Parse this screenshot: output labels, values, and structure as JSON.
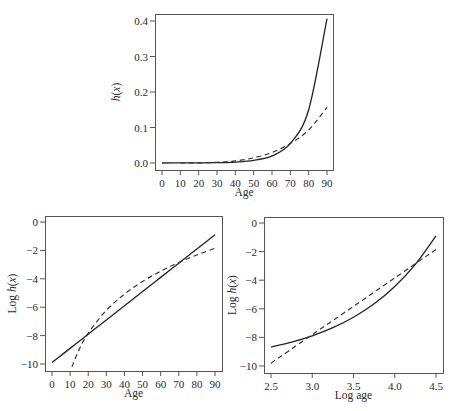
{
  "chart_data": [
    {
      "id": "top",
      "type": "line",
      "title": "",
      "xlabel": "Age",
      "ylabel": "h(x)",
      "xlim": [
        0,
        90
      ],
      "ylim": [
        0.0,
        0.4
      ],
      "xticks": [
        0,
        10,
        20,
        30,
        40,
        50,
        60,
        70,
        80,
        90
      ],
      "xtick_labels": [
        "0",
        "10",
        "20",
        "30",
        "40",
        "50",
        "60",
        "70",
        "80",
        "90"
      ],
      "yticks": [
        0.0,
        0.1,
        0.2,
        0.3,
        0.4
      ],
      "ytick_labels": [
        "0.0",
        "0.1",
        "0.2",
        "0.3",
        "0.4"
      ],
      "grid": false,
      "legend": null,
      "series": [
        {
          "name": "solid",
          "style": "solid",
          "x": [
            0,
            10,
            20,
            30,
            40,
            50,
            60,
            70,
            80,
            90
          ],
          "values": [
            5e-05,
            0.00014,
            0.00037,
            0.001,
            0.0027,
            0.0074,
            0.02,
            0.055,
            0.15,
            0.407
          ]
        },
        {
          "name": "dashed",
          "style": "dashed",
          "x": [
            10,
            20,
            30,
            40,
            50,
            60,
            70,
            80,
            90
          ],
          "values": [
            3e-05,
            0.0004,
            0.0019,
            0.006,
            0.0145,
            0.0297,
            0.055,
            0.093,
            0.157
          ]
        }
      ]
    },
    {
      "id": "bottom-left",
      "type": "line",
      "title": "",
      "xlabel": "Age",
      "ylabel": "Log h(x)",
      "xlim": [
        0,
        90
      ],
      "ylim": [
        -10,
        0
      ],
      "xticks": [
        0,
        10,
        20,
        30,
        40,
        50,
        60,
        70,
        80,
        90
      ],
      "xtick_labels": [
        "0",
        "10",
        "20",
        "30",
        "40",
        "50",
        "60",
        "70",
        "80",
        "90"
      ],
      "yticks": [
        0,
        -2,
        -4,
        -6,
        -8,
        -10
      ],
      "ytick_labels": [
        "0",
        "-2",
        "-4",
        "-6",
        "-8",
        "-10"
      ],
      "grid": false,
      "legend": null,
      "series": [
        {
          "name": "solid",
          "style": "solid",
          "x": [
            0,
            10,
            20,
            30,
            40,
            50,
            60,
            70,
            80,
            90
          ],
          "values": [
            -9.9,
            -8.9,
            -7.9,
            -6.9,
            -5.9,
            -4.9,
            -3.9,
            -2.9,
            -1.9,
            -0.9
          ]
        },
        {
          "name": "dashed",
          "style": "dashed",
          "x": [
            11,
            15,
            20,
            30,
            40,
            50,
            60,
            70,
            80,
            90
          ],
          "values": [
            -10.2,
            -8.97,
            -7.83,
            -6.22,
            -5.08,
            -4.19,
            -3.47,
            -2.85,
            -2.32,
            -1.85
          ]
        }
      ]
    },
    {
      "id": "bottom-right",
      "type": "line",
      "title": "",
      "xlabel": "Log age",
      "ylabel": "Log h(x)",
      "xlim": [
        2.5,
        4.5
      ],
      "ylim": [
        -10,
        0
      ],
      "xticks": [
        2.5,
        3.0,
        3.5,
        4.0,
        4.5
      ],
      "xtick_labels": [
        "2.5",
        "3.0",
        "3.5",
        "4.0",
        "4.5"
      ],
      "yticks": [
        0,
        -2,
        -4,
        -6,
        -8,
        -10
      ],
      "ytick_labels": [
        "0",
        "-2",
        "-4",
        "-6",
        "-8",
        "-10"
      ],
      "grid": false,
      "legend": null,
      "series": [
        {
          "name": "solid",
          "style": "solid",
          "x": [
            2.5,
            2.75,
            3.0,
            3.25,
            3.5,
            3.75,
            4.0,
            4.25,
            4.5
          ],
          "values": [
            -8.68,
            -8.33,
            -7.89,
            -7.32,
            -6.59,
            -5.65,
            -4.44,
            -2.89,
            -0.9
          ]
        },
        {
          "name": "dashed",
          "style": "dashed",
          "x": [
            2.5,
            3.0,
            3.5,
            4.0,
            4.5
          ],
          "values": [
            -9.8,
            -7.81,
            -5.83,
            -3.84,
            -1.85
          ]
        }
      ]
    }
  ]
}
